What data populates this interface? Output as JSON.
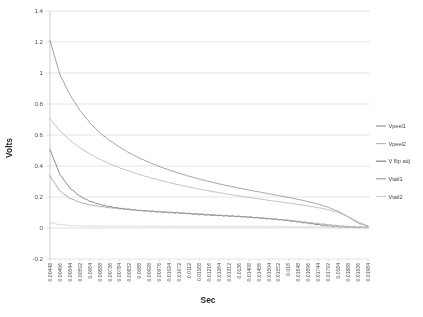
{
  "chart_data": {
    "type": "line",
    "title": "",
    "xlabel": "Sec",
    "ylabel": "Volts",
    "ylim": [
      -0.2,
      1.4
    ],
    "ytick_step": 0.2,
    "grid": true,
    "legend_position": "right",
    "yticks": [
      "1.4",
      "1.2",
      "1",
      "0.8",
      "0.6",
      "0.4",
      "0.2",
      "0",
      "-0.2"
    ],
    "ytick_values": [
      1.4,
      1.2,
      1,
      0.8,
      0.6,
      0.4,
      0.2,
      0,
      -0.2
    ],
    "categories": [
      "0.00448",
      "0.00496",
      "0.00544",
      "0.00592",
      "0.0064",
      "0.00688",
      "0.00736",
      "0.00784",
      "0.00832",
      "0.0088",
      "0.00928",
      "0.00976",
      "0.01024",
      "0.01072",
      "0.0112",
      "0.01168",
      "0.01216",
      "0.01264",
      "0.01312",
      "0.0136",
      "0.01408",
      "0.01456",
      "0.01504",
      "0.01552",
      "0.016",
      "0.01648",
      "0.01696",
      "0.01744",
      "0.01792",
      "0.0184",
      "0.01888",
      "0.01936",
      "0.01984"
    ],
    "x_step": 0.00048,
    "series": [
      {
        "name": "Vpeel1",
        "color": "#8c8c8c",
        "values": [
          1.21,
          0.99,
          0.86,
          0.76,
          0.68,
          0.615,
          0.565,
          0.522,
          0.484,
          0.451,
          0.423,
          0.397,
          0.374,
          0.353,
          0.334,
          0.316,
          0.3,
          0.285,
          0.271,
          0.258,
          0.245,
          0.233,
          0.221,
          0.209,
          0.197,
          0.184,
          0.17,
          0.154,
          0.134,
          0.108,
          0.072,
          0.032,
          0.012
        ]
      },
      {
        "name": "Vpeel2",
        "color": "#b5b5b5",
        "values": [
          0.705,
          0.627,
          0.566,
          0.518,
          0.478,
          0.444,
          0.415,
          0.389,
          0.366,
          0.345,
          0.326,
          0.309,
          0.293,
          0.278,
          0.264,
          0.251,
          0.239,
          0.228,
          0.217,
          0.207,
          0.197,
          0.188,
          0.179,
          0.17,
          0.161,
          0.152,
          0.142,
          0.131,
          0.118,
          0.1,
          0.074,
          0.04,
          0.014
        ]
      },
      {
        "name": "V flip adj",
        "color": "#707070",
        "values": [
          0.505,
          0.345,
          0.258,
          0.205,
          0.173,
          0.152,
          0.138,
          0.128,
          0.12,
          0.113,
          0.108,
          0.103,
          0.0995,
          0.0965,
          0.0925,
          0.0875,
          0.0835,
          0.0805,
          0.0775,
          0.0745,
          0.0705,
          0.0655,
          0.0605,
          0.0545,
          0.0475,
          0.0395,
          0.0305,
          0.0215,
          0.0135,
          0.0075,
          0.0045,
          0.0035,
          0.0035
        ]
      },
      {
        "name": "Vtail1",
        "color": "#9a9a9a",
        "values": [
          0.335,
          0.238,
          0.192,
          0.166,
          0.15,
          0.139,
          0.131,
          0.124,
          0.119,
          0.114,
          0.11,
          0.106,
          0.102,
          0.0985,
          0.0945,
          0.0905,
          0.0865,
          0.0825,
          0.0785,
          0.0745,
          0.07,
          0.0655,
          0.0605,
          0.055,
          0.049,
          0.0425,
          0.0355,
          0.0285,
          0.0215,
          0.015,
          0.01,
          0.007,
          0.006
        ]
      },
      {
        "name": "Vtail2",
        "color": "#d2d2d2",
        "values": [
          0.035,
          0.022,
          0.016,
          0.0135,
          0.0125,
          0.012,
          0.0118,
          0.0116,
          0.0114,
          0.0112,
          0.011,
          0.0108,
          0.0106,
          0.0104,
          0.0102,
          0.01,
          0.0098,
          0.0096,
          0.0094,
          0.0092,
          0.009,
          0.0088,
          0.0086,
          0.0084,
          0.0082,
          0.008,
          0.0076,
          0.0072,
          0.0066,
          0.006,
          0.0052,
          0.0046,
          0.0042
        ]
      }
    ]
  },
  "legend": {
    "items": [
      {
        "label": "Vpeel1"
      },
      {
        "label": "Vpeel2"
      },
      {
        "label": "V flip adj"
      },
      {
        "label": "Vtail1"
      },
      {
        "label": "Vtail2"
      }
    ]
  }
}
